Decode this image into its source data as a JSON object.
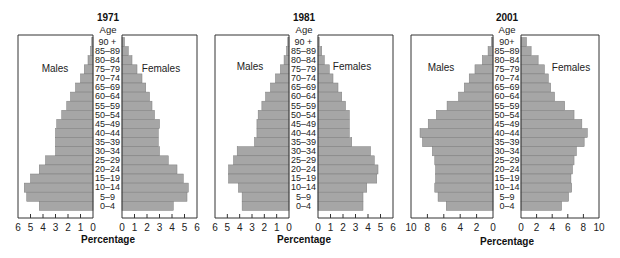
{
  "chart_data": [
    {
      "type": "bar",
      "subtype": "population-pyramid",
      "title": "1971",
      "age_header": "Age",
      "left_label": "Males",
      "right_label": "Females",
      "xlabel": "Percentage",
      "xlim": [
        0,
        6
      ],
      "ticks": [
        0,
        1,
        2,
        3,
        4,
        5,
        6
      ],
      "categories": [
        "90 +",
        "85–89",
        "80–84",
        "75–79",
        "70–74",
        "65–69",
        "60–64",
        "55–59",
        "50–54",
        "45–49",
        "40–44",
        "35–39",
        "30–34",
        "25–29",
        "20–24",
        "15–19",
        "10–14",
        "5–9",
        "0–4"
      ],
      "series": [
        {
          "name": "Males",
          "values": [
            0.1,
            0.2,
            0.4,
            0.7,
            1.0,
            1.4,
            1.8,
            2.1,
            2.5,
            2.9,
            3.0,
            3.0,
            3.0,
            3.8,
            4.3,
            5.0,
            5.5,
            5.3,
            4.3
          ]
        },
        {
          "name": "Females",
          "values": [
            0.2,
            0.5,
            0.8,
            1.2,
            1.6,
            1.9,
            2.2,
            2.4,
            2.6,
            3.0,
            2.9,
            2.9,
            3.0,
            3.7,
            4.4,
            4.9,
            5.3,
            5.2,
            4.1
          ]
        }
      ]
    },
    {
      "type": "bar",
      "subtype": "population-pyramid",
      "title": "1981",
      "age_header": "Age",
      "left_label": "Males",
      "right_label": "Females",
      "xlabel": "Percentage",
      "xlim": [
        0,
        6
      ],
      "ticks": [
        0,
        1,
        2,
        3,
        4,
        5,
        6
      ],
      "categories": [
        "90 +",
        "85–89",
        "80–84",
        "75–79",
        "70–74",
        "65–69",
        "60–64",
        "55–59",
        "50–54",
        "45–49",
        "40–44",
        "35–39",
        "30–34",
        "25–29",
        "20–24",
        "15–19",
        "10–14",
        "5–9",
        "0–4"
      ],
      "series": [
        {
          "name": "Males",
          "values": [
            0.1,
            0.2,
            0.4,
            0.7,
            1.1,
            1.5,
            1.9,
            2.2,
            2.5,
            2.6,
            2.6,
            2.8,
            4.2,
            4.5,
            4.9,
            4.9,
            4.1,
            3.8,
            3.8
          ]
        },
        {
          "name": "Females",
          "values": [
            0.1,
            0.3,
            0.5,
            0.9,
            1.2,
            1.6,
            1.9,
            2.2,
            2.5,
            2.5,
            2.5,
            2.7,
            4.2,
            4.5,
            4.8,
            4.7,
            3.9,
            3.6,
            3.6
          ]
        }
      ]
    },
    {
      "type": "bar",
      "subtype": "population-pyramid",
      "title": "2001",
      "age_header": "Age",
      "left_label": "Males",
      "right_label": "Females",
      "xlabel": "Percentage",
      "xlim": [
        0,
        10
      ],
      "ticks": [
        0,
        2,
        4,
        6,
        8,
        10
      ],
      "categories": [
        "90+",
        "85–89",
        "80–84",
        "75–79",
        "70–74",
        "65–69",
        "60–64",
        "55–59",
        "50–54",
        "45–49",
        "40–44",
        "35–39",
        "30–34",
        "25–29",
        "20–24",
        "15–19",
        "10–14",
        "5–9",
        "0–4"
      ],
      "series": [
        {
          "name": "Males",
          "values": [
            0.2,
            0.6,
            1.3,
            2.2,
            2.9,
            3.5,
            4.2,
            5.6,
            6.9,
            7.9,
            8.9,
            8.6,
            7.4,
            7.1,
            7.0,
            7.0,
            7.1,
            6.7,
            5.7
          ]
        },
        {
          "name": "Females",
          "values": [
            0.7,
            1.3,
            2.2,
            3.0,
            3.5,
            3.8,
            4.3,
            5.6,
            6.8,
            7.8,
            8.5,
            8.1,
            7.1,
            6.8,
            6.6,
            6.4,
            6.5,
            6.1,
            5.2
          ]
        }
      ]
    }
  ]
}
